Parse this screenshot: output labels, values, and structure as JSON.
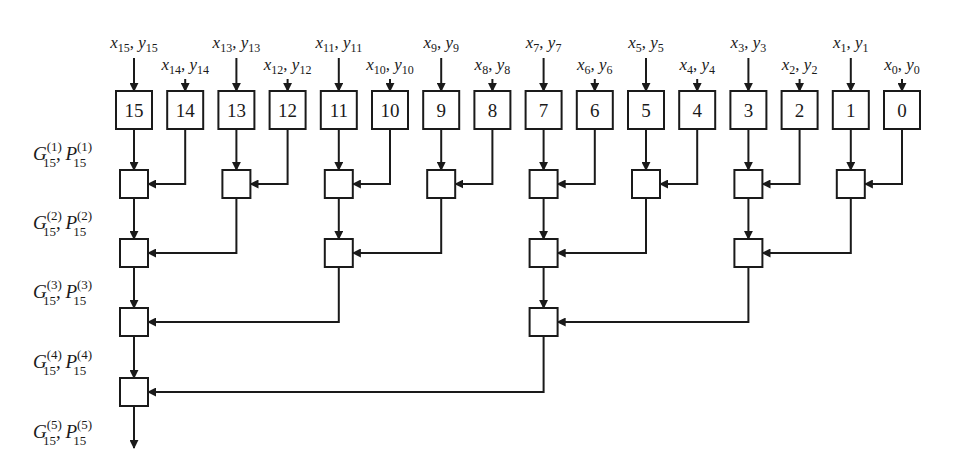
{
  "diagram": {
    "type": "parallel-prefix-adder-tree",
    "colors": {
      "stroke": "#1a1a1a",
      "background": "#ffffff"
    },
    "inputs": [
      {
        "index": 15,
        "x": "x",
        "y": "y",
        "sub": "15",
        "row": "high"
      },
      {
        "index": 14,
        "x": "x",
        "y": "y",
        "sub": "14",
        "row": "low"
      },
      {
        "index": 13,
        "x": "x",
        "y": "y",
        "sub": "13",
        "row": "high"
      },
      {
        "index": 12,
        "x": "x",
        "y": "y",
        "sub": "12",
        "row": "low"
      },
      {
        "index": 11,
        "x": "x",
        "y": "y",
        "sub": "11",
        "row": "high"
      },
      {
        "index": 10,
        "x": "x",
        "y": "y",
        "sub": "10",
        "row": "low"
      },
      {
        "index": 9,
        "x": "x",
        "y": "y",
        "sub": "9",
        "row": "high"
      },
      {
        "index": 8,
        "x": "x",
        "y": "y",
        "sub": "8",
        "row": "low"
      },
      {
        "index": 7,
        "x": "x",
        "y": "y",
        "sub": "7",
        "row": "high"
      },
      {
        "index": 6,
        "x": "x",
        "y": "y",
        "sub": "6",
        "row": "low"
      },
      {
        "index": 5,
        "x": "x",
        "y": "y",
        "sub": "5",
        "row": "high"
      },
      {
        "index": 4,
        "x": "x",
        "y": "y",
        "sub": "4",
        "row": "low"
      },
      {
        "index": 3,
        "x": "x",
        "y": "y",
        "sub": "3",
        "row": "high"
      },
      {
        "index": 2,
        "x": "x",
        "y": "y",
        "sub": "2",
        "row": "low"
      },
      {
        "index": 1,
        "x": "x",
        "y": "y",
        "sub": "1",
        "row": "high"
      },
      {
        "index": 0,
        "x": "x",
        "y": "y",
        "sub": "0",
        "row": "low"
      }
    ],
    "boxes": [
      "15",
      "14",
      "13",
      "12",
      "11",
      "10",
      "9",
      "8",
      "7",
      "6",
      "5",
      "4",
      "3",
      "2",
      "1",
      "0"
    ],
    "levels": [
      {
        "level": 1,
        "nodes": [
          {
            "at": 15,
            "from": 14
          },
          {
            "at": 13,
            "from": 12
          },
          {
            "at": 11,
            "from": 10
          },
          {
            "at": 9,
            "from": 8
          },
          {
            "at": 7,
            "from": 6
          },
          {
            "at": 5,
            "from": 4
          },
          {
            "at": 3,
            "from": 2
          },
          {
            "at": 1,
            "from": 0
          }
        ]
      },
      {
        "level": 2,
        "nodes": [
          {
            "at": 15,
            "from": 13
          },
          {
            "at": 11,
            "from": 9
          },
          {
            "at": 7,
            "from": 5
          },
          {
            "at": 3,
            "from": 1
          }
        ]
      },
      {
        "level": 3,
        "nodes": [
          {
            "at": 15,
            "from": 11
          },
          {
            "at": 7,
            "from": 3
          }
        ]
      },
      {
        "level": 4,
        "nodes": [
          {
            "at": 15,
            "from": 7
          }
        ]
      }
    ],
    "side_labels": [
      {
        "g": "G",
        "p": "P",
        "sup": "(1)",
        "sub": "15"
      },
      {
        "g": "G",
        "p": "P",
        "sup": "(2)",
        "sub": "15"
      },
      {
        "g": "G",
        "p": "P",
        "sup": "(3)",
        "sub": "15"
      },
      {
        "g": "G",
        "p": "P",
        "sup": "(4)",
        "sub": "15"
      },
      {
        "g": "G",
        "p": "P",
        "sup": "(5)",
        "sub": "15"
      }
    ]
  }
}
